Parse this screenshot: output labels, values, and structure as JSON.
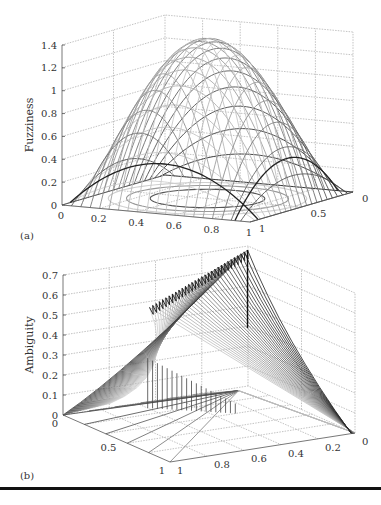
{
  "chart_data": [
    {
      "panel": "(a)",
      "type": "surface3d",
      "title": "",
      "zlabel": "Fuzziness",
      "xlabel": "",
      "ylabel": "",
      "x_ticks": [
        "0",
        "0.2",
        "0.4",
        "0.6",
        "0.8",
        "1"
      ],
      "y_ticks": [
        "1",
        "0.5",
        "0"
      ],
      "z_ticks": [
        "0",
        "0.2",
        "0.4",
        "0.6",
        "0.8",
        "1",
        "1.2",
        "1.4"
      ],
      "xlim": [
        0,
        1
      ],
      "ylim": [
        0,
        1
      ],
      "zlim": [
        0,
        1.4
      ],
      "grid": true,
      "description": "Dome-shaped mesh surface, peak ~1.4 near (0.5,0.5), falling to 0 at domain edges; contour ellipses drawn on base plane",
      "peak": 1.4,
      "mesh_resolution": 21,
      "contour_levels": [
        0.2,
        0.6,
        1.0
      ]
    },
    {
      "panel": "(b)",
      "type": "surface3d",
      "title": "",
      "zlabel": "Ambiguity",
      "xlabel": "",
      "ylabel": "",
      "x_ticks": [
        "0",
        "0.5",
        "1"
      ],
      "y_ticks": [
        "1",
        "0.8",
        "0.6",
        "0.4",
        "0.2",
        "0"
      ],
      "z_ticks": [
        "0",
        "0.1",
        "0.2",
        "0.3",
        "0.4",
        "0.5",
        "0.6",
        "0.7"
      ],
      "xlim": [
        0,
        1
      ],
      "ylim": [
        0,
        1
      ],
      "zlim": [
        0,
        0.7
      ],
      "grid": true,
      "description": "Ruled wedge-shaped mesh surface rising to ~0.69 along the back edge, 0 at outer corners; radial lines on base plane converge at a point",
      "peak": 0.69,
      "mesh_resolution": 30
    }
  ]
}
